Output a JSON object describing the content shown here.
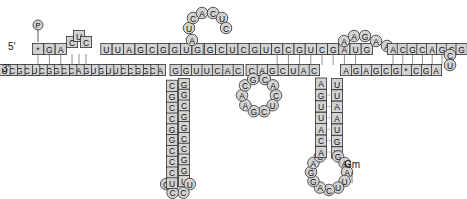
{
  "labels": {
    "five_prime": "5'",
    "three_prime": "3'",
    "phosphate": "P",
    "gm_modification": "Gm"
  },
  "colors": {
    "nucleotide_fill": "#d2d2d2",
    "outline": "#333333",
    "text": "#111111",
    "background": "#ffffff"
  },
  "strands": {
    "top_left": [
      "*",
      "G",
      "A",
      "C",
      "U",
      "C",
      "U",
      "U",
      "A",
      "G",
      "C",
      "G",
      "G",
      "U",
      "G"
    ],
    "hairpin1_loop": [
      "A",
      "U",
      "C",
      "A",
      "C",
      "U",
      "C"
    ],
    "top_middle": [
      "G",
      "C",
      "U",
      "C",
      "G",
      "U",
      "G",
      "C",
      "G",
      "U",
      "C",
      "G",
      "A",
      "U",
      "G"
    ],
    "top_bulge": [
      "A",
      "A",
      "G",
      "A",
      "A"
    ],
    "top_right": [
      "A",
      "C",
      "G",
      "C",
      "A",
      "G",
      "C",
      "G"
    ],
    "right_loop": [
      "C",
      "U"
    ],
    "bottom_right": [
      "A",
      "G",
      "C",
      "*",
      "G",
      "C",
      "G",
      "A",
      "G",
      "A"
    ],
    "stem3_right": [
      "U",
      "U",
      "A",
      "A",
      "U",
      "G",
      "Ψ"
    ],
    "loop3": [
      "G",
      "A",
      "A",
      "U",
      "U",
      "C",
      "A",
      "G",
      "G",
      "A",
      "C"
    ],
    "stem3_left": [
      "A",
      "C",
      "A",
      "U",
      "U",
      "G",
      "A"
    ],
    "bottom_middle": [
      "C",
      "A",
      "U",
      "C",
      "G",
      "A",
      "C"
    ],
    "loop2": [
      "C",
      "A",
      "C",
      "U",
      "C",
      "G",
      "A",
      "A",
      "C",
      "G"
    ],
    "bottom_middle2": [
      "C",
      "A",
      "C",
      "U",
      "U",
      "G",
      "G"
    ],
    "stem1_right": [
      "G",
      "G",
      "C",
      "G",
      "G",
      "C",
      "C",
      "G",
      "G",
      "U"
    ],
    "loop1": [
      "U",
      "C",
      "C",
      "C"
    ],
    "stem1_left": [
      "U",
      "C",
      "C",
      "C",
      "G",
      "G",
      "C",
      "C",
      "G",
      "C"
    ],
    "bottom_left": [
      "A",
      "C",
      "G",
      "G",
      "C",
      "C",
      "U",
      "U",
      "G",
      "U",
      "G",
      "A",
      "C",
      "C",
      "G",
      "G",
      "C",
      "U",
      "C",
      "G",
      "C",
      "U"
    ]
  }
}
